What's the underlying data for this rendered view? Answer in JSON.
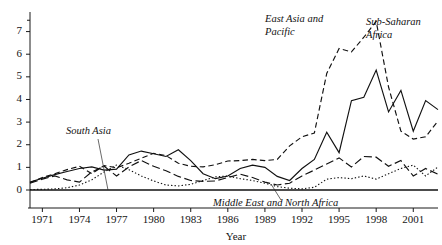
{
  "chart_data": {
    "type": "line",
    "title": "",
    "xlabel": "Year",
    "ylabel": "",
    "xlim": [
      1970,
      2003
    ],
    "ylim": [
      0,
      7.6
    ],
    "grid": false,
    "legend_position": "inline-annotations",
    "x_tick_labels": [
      "1971",
      "1974",
      "1977",
      "1980",
      "1983",
      "1986",
      "1989",
      "1992",
      "1995",
      "1998",
      "2001"
    ],
    "x_ticks": [
      1971,
      1974,
      1977,
      1980,
      1983,
      1986,
      1989,
      1992,
      1995,
      1998,
      2001
    ],
    "y_tick_labels": [
      "0",
      "1",
      "2",
      "3",
      "4",
      "5",
      "6",
      "7"
    ],
    "y_ticks": [
      0,
      1,
      2,
      3,
      4,
      5,
      6,
      7
    ],
    "x": [
      1970,
      1971,
      1972,
      1973,
      1974,
      1975,
      1976,
      1977,
      1978,
      1979,
      1980,
      1981,
      1982,
      1983,
      1984,
      1985,
      1986,
      1987,
      1988,
      1989,
      1990,
      1991,
      1992,
      1993,
      1994,
      1995,
      1996,
      1997,
      1998,
      1999,
      2000,
      2001,
      2002,
      2003
    ],
    "series": [
      {
        "name": "Sub-Saharan Africa",
        "style": "solid",
        "values": [
          0.35,
          0.52,
          0.68,
          0.82,
          0.95,
          1.02,
          0.88,
          0.92,
          1.55,
          1.72,
          1.6,
          1.48,
          1.78,
          1.3,
          0.72,
          0.5,
          0.62,
          0.95,
          1.1,
          1.0,
          0.6,
          0.42,
          0.95,
          1.35,
          2.55,
          1.65,
          3.95,
          4.1,
          5.3,
          3.45,
          4.4,
          2.6,
          3.95,
          3.55
        ]
      },
      {
        "name": "East Asia and Pacific",
        "style": "dashed",
        "values": [
          0.32,
          0.55,
          0.72,
          0.9,
          1.05,
          0.72,
          1.08,
          0.98,
          1.18,
          1.4,
          1.62,
          1.52,
          1.18,
          1.05,
          1.02,
          1.12,
          1.28,
          1.3,
          1.35,
          1.3,
          1.35,
          1.95,
          2.35,
          2.52,
          5.15,
          6.25,
          6.1,
          6.75,
          7.45,
          4.55,
          2.6,
          2.25,
          2.35,
          3.05
        ]
      },
      {
        "name": "South Asia",
        "style": "long-dash",
        "values": [
          0.3,
          0.48,
          0.62,
          0.45,
          0.35,
          0.8,
          1.05,
          0.62,
          1.02,
          1.3,
          1.05,
          0.85,
          0.6,
          0.42,
          0.38,
          0.4,
          0.55,
          0.7,
          0.55,
          0.35,
          0.22,
          0.3,
          0.62,
          0.88,
          1.15,
          1.42,
          1.02,
          1.48,
          1.45,
          1.05,
          1.3,
          0.62,
          0.95,
          0.7
        ]
      },
      {
        "name": "Middle East and North Africa",
        "style": "dotted",
        "values": [
          0.02,
          0.03,
          0.05,
          0.1,
          0.22,
          0.45,
          0.8,
          1.1,
          0.9,
          0.62,
          0.4,
          0.22,
          0.18,
          0.25,
          0.42,
          0.58,
          0.62,
          0.5,
          0.42,
          0.3,
          0.15,
          0.08,
          0.05,
          0.12,
          0.48,
          0.55,
          0.5,
          0.62,
          0.48,
          0.72,
          0.95,
          1.1,
          0.62,
          1.02
        ]
      }
    ],
    "annotations": [
      {
        "name": "east-asia-and-pacific",
        "text_line1": "East Asia and",
        "text_line2": "Pacific"
      },
      {
        "name": "sub-saharan-africa",
        "text_line1": "Sub-Saharan",
        "text_line2": "Africa"
      },
      {
        "name": "south-asia",
        "text_line1": "South Asia",
        "text_line2": ""
      },
      {
        "name": "middle-east-and-north-africa",
        "text_line1": "Middle East and North Africa",
        "text_line2": ""
      }
    ]
  },
  "labels": {
    "x_axis_title": "Year",
    "east_asia_l1": "East Asia and",
    "east_asia_l2": "Pacific",
    "subsaharan_l1": "Sub-Saharan",
    "subsaharan_l2": "Africa",
    "south_asia": "South Asia",
    "mena": "Middle East and North Africa",
    "y0": "0",
    "y1": "1",
    "y2": "2",
    "y3": "3",
    "y4": "4",
    "y5": "5",
    "y6": "6",
    "y7": "7",
    "x1971": "1971",
    "x1974": "1974",
    "x1977": "1977",
    "x1980": "1980",
    "x1983": "1983",
    "x1986": "1986",
    "x1989": "1989",
    "x1992": "1992",
    "x1995": "1995",
    "x1998": "1998",
    "x2001": "2001"
  },
  "colors": {
    "line": "#111111",
    "axis": "#1a1a1a",
    "background": "#ffffff"
  }
}
